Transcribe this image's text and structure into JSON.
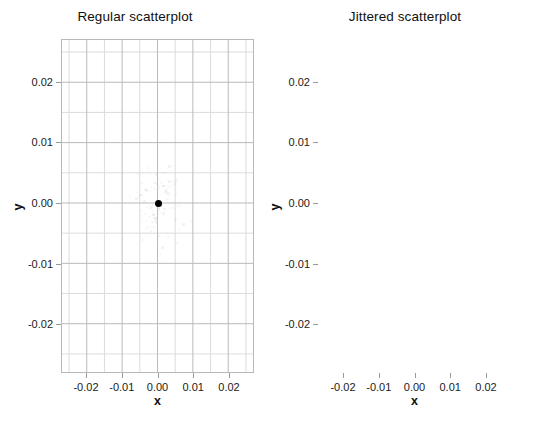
{
  "figure": {
    "width": 540,
    "height": 427,
    "background": "#ffffff",
    "grid_major_color": "#b9b9b9",
    "grid_minor_color": "#dcdcdc",
    "frame_color": "#b9b9b9",
    "point_color": "#000000"
  },
  "chart_data": [
    {
      "type": "scatter",
      "title": "Regular scatterplot",
      "xlabel": "x",
      "ylabel": "y",
      "xlim": [
        -0.027,
        0.027
      ],
      "ylim": [
        -0.028,
        0.027
      ],
      "xticks": [
        -0.02,
        -0.01,
        0.0,
        0.01,
        0.02
      ],
      "xticklabels": [
        "-0.02",
        "-0.01",
        "0.00",
        "0.01",
        "0.02"
      ],
      "yticks": [
        -0.02,
        -0.01,
        0.0,
        0.01,
        0.02
      ],
      "yticklabels": [
        "-0.02",
        "-0.01",
        "0.00",
        "0.01",
        "0.02"
      ],
      "grid": true,
      "grid_minor_step": 0.005,
      "legend": null,
      "points": [
        {
          "x": 0.0,
          "y": 0.0
        }
      ],
      "note": "All 100 observations are identical at (0, 0) and overplot into a single visible marker."
    },
    {
      "type": "scatter",
      "title": "Jittered scatterplot",
      "xlabel": "x",
      "ylabel": "y",
      "xlim": [
        -0.027,
        0.027
      ],
      "ylim": [
        -0.028,
        0.027
      ],
      "xticks": [
        -0.02,
        -0.01,
        0.0,
        0.01,
        0.02
      ],
      "xticklabels": [
        "-0.02",
        "-0.01",
        "0.00",
        "0.01",
        "0.02"
      ],
      "yticks": [
        -0.02,
        -0.01,
        0.0,
        0.01,
        0.02
      ],
      "yticklabels": [
        "-0.02",
        "-0.01",
        "0.00",
        "0.01",
        "0.02"
      ],
      "grid": true,
      "grid_minor_step": 0.005,
      "legend": null,
      "points": [
        {
          "x": -0.0016,
          "y": 0.0093
        },
        {
          "x": -0.0038,
          "y": 0.004
        },
        {
          "x": -0.0085,
          "y": -0.0058
        },
        {
          "x": 0.0057,
          "y": -0.0074
        }
      ],
      "note": "Jitter spreads the overplotted observations so individual points become visible."
    }
  ]
}
